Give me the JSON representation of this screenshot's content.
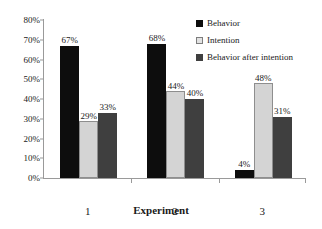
{
  "chart_data": {
    "type": "bar",
    "title": "",
    "subtitle": "",
    "xlabel": "Experiment",
    "ylabel": "",
    "categories": [
      "1",
      "2",
      "3"
    ],
    "series": [
      {
        "name": "Behavior",
        "color": "#0d0d0d",
        "values": [
          67,
          68,
          4
        ],
        "labels": [
          "67%",
          "68%",
          "4%"
        ]
      },
      {
        "name": "Intention",
        "color": "#d4d4d4",
        "values": [
          29,
          44,
          48
        ],
        "labels": [
          "29%",
          "44%",
          "48%"
        ]
      },
      {
        "name": "Behavior after intention",
        "color": "#3f3f3f",
        "values": [
          33,
          40,
          31
        ],
        "labels": [
          "33%",
          "40%",
          "31%"
        ]
      }
    ],
    "ylim": [
      0,
      80
    ],
    "ytick_values": [
      0,
      10,
      20,
      30,
      40,
      50,
      60,
      70,
      80
    ],
    "ytick_labels": [
      "0%",
      "10%",
      "20%",
      "30%",
      "40%",
      "50%",
      "60%",
      "70%",
      "80%"
    ],
    "grid": false,
    "legend_position": "top-right",
    "value_labels_shown": true,
    "unit": "%"
  },
  "axis": {
    "x_title": "Experiment"
  }
}
